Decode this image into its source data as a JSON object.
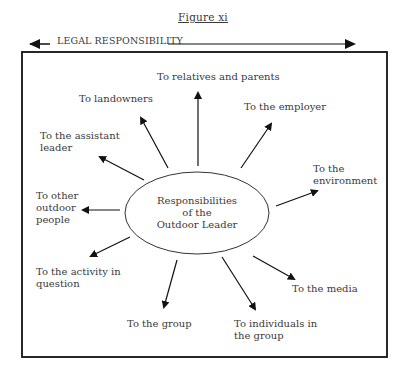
{
  "figure": {
    "caption": "Figure xi",
    "legal_arrow_label": "LEGAL RESPONSIBILITY",
    "center": {
      "line1": "Responsibilities",
      "line2": "of the",
      "line3": "Outdoor Leader"
    },
    "responsibilities": [
      {
        "id": "relatives",
        "line1": "To relatives and parents",
        "line2": ""
      },
      {
        "id": "landowners",
        "line1": "To landowners",
        "line2": ""
      },
      {
        "id": "employer",
        "line1": "To the employer",
        "line2": ""
      },
      {
        "id": "assistant",
        "line1": "To the assistant",
        "line2": "leader"
      },
      {
        "id": "environment",
        "line1": "To the",
        "line2": "environment"
      },
      {
        "id": "other_outdoor",
        "line1": "To other",
        "line2": "outdoor",
        "line3": "people"
      },
      {
        "id": "activity",
        "line1": "To the activity in",
        "line2": "question"
      },
      {
        "id": "media",
        "line1": "To the media",
        "line2": ""
      },
      {
        "id": "group",
        "line1": "To the group",
        "line2": ""
      },
      {
        "id": "individuals",
        "line1": "To individuals in",
        "line2": "the group"
      }
    ]
  }
}
